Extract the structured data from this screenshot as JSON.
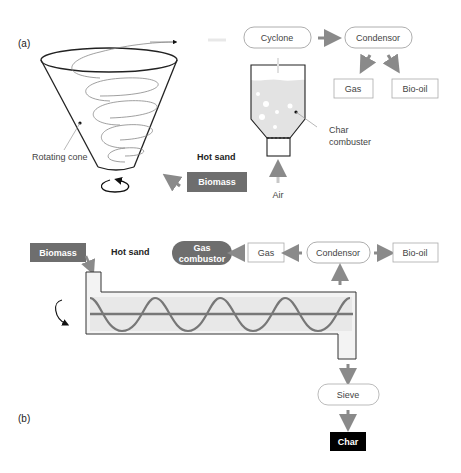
{
  "panel_a": {
    "label": "(a)",
    "rotating_cone": "Rotating cone",
    "hot_sand": "Hot sand",
    "biomass": "Biomass",
    "cyclone": "Cyclone",
    "condensor": "Condensor",
    "gas": "Gas",
    "bio_oil": "Bio-oil",
    "char_combuster_line1": "Char",
    "char_combuster_line2": "combuster",
    "air": "Air"
  },
  "panel_b": {
    "label": "(b)",
    "biomass": "Biomass",
    "hot_sand": "Hot sand",
    "gas_combustor_line1": "Gas",
    "gas_combustor_line2": "combustor",
    "gas": "Gas",
    "condensor": "Condensor",
    "bio_oil": "Bio-oil",
    "sieve": "Sieve",
    "char": "Char"
  },
  "colors": {
    "dark_box": "#6e6e6e",
    "arrow": "#8a8a8a",
    "light_fill": "#e6e6e6",
    "char_box": "#000000"
  }
}
